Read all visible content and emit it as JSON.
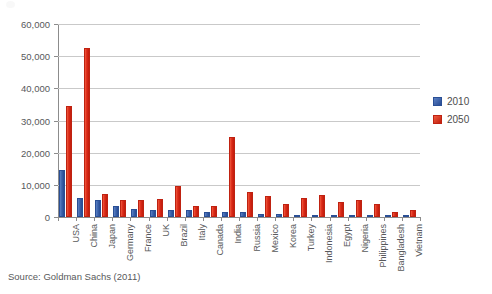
{
  "chart_data": {
    "type": "bar",
    "title": "",
    "subtitle": "",
    "xlabel": "",
    "ylabel": "",
    "ylim": [
      0,
      60000
    ],
    "ytick_values": [
      0,
      10000,
      20000,
      30000,
      40000,
      50000,
      60000
    ],
    "ytick_labels": [
      "0",
      "10,000",
      "20,000",
      "30,000",
      "40,000",
      "50,000",
      "60,000"
    ],
    "grid": true,
    "legend_position": "right",
    "categories": [
      "USA",
      "China",
      "Japan",
      "Germany",
      "France",
      "UK",
      "Brazil",
      "Italy",
      "Canada",
      "India",
      "Russia",
      "Mexico",
      "Korea",
      "Turkey",
      "Indonesia",
      "Egypt",
      "Nigeria",
      "Philippines",
      "Bangladesh",
      "Vietnam"
    ],
    "series": [
      {
        "name": "2010",
        "color": "#3c63ab",
        "values": [
          14600,
          5900,
          5400,
          3300,
          2600,
          2300,
          2100,
          2050,
          1600,
          1600,
          1500,
          1000,
          1000,
          700,
          700,
          220,
          200,
          190,
          110,
          100
        ]
      },
      {
        "name": "2050",
        "color": "#dc2a18",
        "values": [
          34600,
          52500,
          7200,
          5200,
          5300,
          5500,
          9500,
          3400,
          3400,
          24900,
          7700,
          6400,
          4000,
          5800,
          6800,
          4600,
          5200,
          4200,
          1700,
          2300
        ]
      }
    ],
    "annotations": []
  },
  "legend": {
    "items": [
      {
        "label": "2010"
      },
      {
        "label": "2050"
      }
    ]
  },
  "source": {
    "text": "Source: Goldman Sachs (2011)"
  }
}
